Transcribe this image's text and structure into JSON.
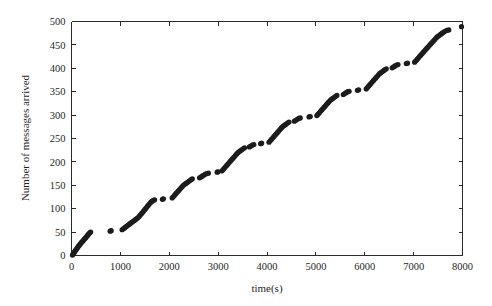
{
  "chart_data": {
    "type": "scatter",
    "title": "",
    "xlabel": "time(s)",
    "ylabel": "Number of messages arrived",
    "xlim": [
      0,
      8000
    ],
    "ylim": [
      0,
      500
    ],
    "xticks": [
      0,
      1000,
      2000,
      3000,
      4000,
      5000,
      6000,
      7000,
      8000
    ],
    "yticks": [
      0,
      50,
      100,
      150,
      200,
      250,
      300,
      350,
      400,
      450,
      500
    ],
    "xtick_labels": [
      "0",
      "1000",
      "2000",
      "3000",
      "4000",
      "5000",
      "6000",
      "7000",
      "8000"
    ],
    "ytick_labels": [
      "0",
      "50",
      "100",
      "150",
      "200",
      "250",
      "300",
      "350",
      "400",
      "450",
      "500"
    ],
    "grid": false,
    "legend": null,
    "marker": "filled-circle",
    "marker_color": "#1c1c1c",
    "marker_size": 2.6,
    "series": [
      {
        "name": "messages arrived",
        "points": [
          [
            20,
            1
          ],
          [
            34,
            3
          ],
          [
            46,
            5
          ],
          [
            58,
            7
          ],
          [
            70,
            9
          ],
          [
            84,
            11
          ],
          [
            96,
            13
          ],
          [
            110,
            15
          ],
          [
            124,
            17
          ],
          [
            138,
            19
          ],
          [
            152,
            21
          ],
          [
            166,
            23
          ],
          [
            182,
            25
          ],
          [
            198,
            27
          ],
          [
            214,
            29
          ],
          [
            232,
            31
          ],
          [
            248,
            33
          ],
          [
            264,
            35
          ],
          [
            282,
            37
          ],
          [
            298,
            39
          ],
          [
            312,
            41
          ],
          [
            328,
            43
          ],
          [
            344,
            45
          ],
          [
            360,
            47
          ],
          [
            378,
            49
          ],
          [
            392,
            50
          ],
          [
            790,
            52
          ],
          [
            812,
            53
          ],
          [
            1035,
            55
          ],
          [
            1060,
            57
          ],
          [
            1085,
            59
          ],
          [
            1110,
            61
          ],
          [
            1135,
            63
          ],
          [
            1160,
            65
          ],
          [
            1185,
            67
          ],
          [
            1210,
            69
          ],
          [
            1236,
            71
          ],
          [
            1262,
            73
          ],
          [
            1288,
            75
          ],
          [
            1312,
            77
          ],
          [
            1338,
            79
          ],
          [
            1362,
            81
          ],
          [
            1388,
            84
          ],
          [
            1412,
            87
          ],
          [
            1436,
            90
          ],
          [
            1460,
            93
          ],
          [
            1484,
            96
          ],
          [
            1508,
            99
          ],
          [
            1530,
            102
          ],
          [
            1552,
            105
          ],
          [
            1576,
            108
          ],
          [
            1600,
            111
          ],
          [
            1624,
            114
          ],
          [
            1650,
            116
          ],
          [
            1676,
            118
          ],
          [
            1700,
            119
          ],
          [
            1860,
            120
          ],
          [
            1880,
            121
          ],
          [
            2060,
            123
          ],
          [
            2085,
            126
          ],
          [
            2110,
            129
          ],
          [
            2135,
            132
          ],
          [
            2160,
            135
          ],
          [
            2186,
            138
          ],
          [
            2212,
            141
          ],
          [
            2238,
            144
          ],
          [
            2264,
            147
          ],
          [
            2290,
            150
          ],
          [
            2316,
            152
          ],
          [
            2342,
            154
          ],
          [
            2368,
            156
          ],
          [
            2394,
            158
          ],
          [
            2420,
            160
          ],
          [
            2446,
            162
          ],
          [
            2472,
            164
          ],
          [
            2620,
            166
          ],
          [
            2650,
            168
          ],
          [
            2680,
            170
          ],
          [
            2710,
            172
          ],
          [
            2740,
            174
          ],
          [
            2770,
            175
          ],
          [
            2800,
            176
          ],
          [
            2980,
            178
          ],
          [
            3000,
            179
          ],
          [
            3080,
            181
          ],
          [
            3105,
            184
          ],
          [
            3130,
            187
          ],
          [
            3155,
            190
          ],
          [
            3180,
            193
          ],
          [
            3205,
            196
          ],
          [
            3230,
            199
          ],
          [
            3255,
            202
          ],
          [
            3280,
            205
          ],
          [
            3305,
            208
          ],
          [
            3330,
            211
          ],
          [
            3355,
            214
          ],
          [
            3380,
            217
          ],
          [
            3406,
            220
          ],
          [
            3432,
            222
          ],
          [
            3458,
            224
          ],
          [
            3484,
            226
          ],
          [
            3510,
            228
          ],
          [
            3540,
            230
          ],
          [
            3640,
            232
          ],
          [
            3670,
            234
          ],
          [
            3700,
            236
          ],
          [
            3730,
            237
          ],
          [
            3870,
            239
          ],
          [
            3890,
            240
          ],
          [
            4040,
            242
          ],
          [
            4065,
            245
          ],
          [
            4090,
            248
          ],
          [
            4115,
            251
          ],
          [
            4140,
            254
          ],
          [
            4165,
            257
          ],
          [
            4190,
            260
          ],
          [
            4215,
            263
          ],
          [
            4240,
            266
          ],
          [
            4265,
            269
          ],
          [
            4290,
            272
          ],
          [
            4316,
            275
          ],
          [
            4342,
            277
          ],
          [
            4368,
            279
          ],
          [
            4394,
            281
          ],
          [
            4420,
            283
          ],
          [
            4450,
            285
          ],
          [
            4560,
            287
          ],
          [
            4590,
            289
          ],
          [
            4620,
            291
          ],
          [
            4650,
            293
          ],
          [
            4680,
            294
          ],
          [
            4860,
            296
          ],
          [
            4885,
            297
          ],
          [
            5020,
            299
          ],
          [
            5045,
            302
          ],
          [
            5070,
            305
          ],
          [
            5095,
            308
          ],
          [
            5120,
            311
          ],
          [
            5145,
            314
          ],
          [
            5170,
            317
          ],
          [
            5195,
            320
          ],
          [
            5220,
            323
          ],
          [
            5246,
            326
          ],
          [
            5272,
            329
          ],
          [
            5298,
            332
          ],
          [
            5324,
            334
          ],
          [
            5350,
            336
          ],
          [
            5376,
            338
          ],
          [
            5402,
            340
          ],
          [
            5430,
            342
          ],
          [
            5560,
            344
          ],
          [
            5590,
            346
          ],
          [
            5620,
            348
          ],
          [
            5650,
            350
          ],
          [
            5680,
            351
          ],
          [
            5850,
            353
          ],
          [
            5875,
            354
          ],
          [
            6030,
            356
          ],
          [
            6055,
            359
          ],
          [
            6080,
            362
          ],
          [
            6105,
            365
          ],
          [
            6130,
            368
          ],
          [
            6155,
            371
          ],
          [
            6180,
            374
          ],
          [
            6205,
            377
          ],
          [
            6230,
            380
          ],
          [
            6256,
            383
          ],
          [
            6282,
            386
          ],
          [
            6308,
            389
          ],
          [
            6334,
            391
          ],
          [
            6360,
            393
          ],
          [
            6386,
            395
          ],
          [
            6412,
            397
          ],
          [
            6440,
            399
          ],
          [
            6560,
            401
          ],
          [
            6590,
            403
          ],
          [
            6620,
            405
          ],
          [
            6650,
            407
          ],
          [
            6680,
            408
          ],
          [
            6850,
            410
          ],
          [
            6875,
            411
          ],
          [
            7020,
            413
          ],
          [
            7045,
            416
          ],
          [
            7070,
            419
          ],
          [
            7095,
            422
          ],
          [
            7120,
            425
          ],
          [
            7145,
            428
          ],
          [
            7170,
            431
          ],
          [
            7195,
            434
          ],
          [
            7220,
            437
          ],
          [
            7246,
            440
          ],
          [
            7272,
            443
          ],
          [
            7298,
            446
          ],
          [
            7324,
            449
          ],
          [
            7350,
            452
          ],
          [
            7376,
            455
          ],
          [
            7402,
            458
          ],
          [
            7428,
            461
          ],
          [
            7454,
            464
          ],
          [
            7480,
            467
          ],
          [
            7506,
            469
          ],
          [
            7532,
            471
          ],
          [
            7558,
            473
          ],
          [
            7584,
            475
          ],
          [
            7610,
            477
          ],
          [
            7640,
            479
          ],
          [
            7680,
            481
          ],
          [
            7720,
            482
          ],
          [
            7980,
            489
          ]
        ]
      }
    ]
  },
  "axes": {
    "x_title": "time(s)",
    "y_title": "Number of messages arrived"
  }
}
